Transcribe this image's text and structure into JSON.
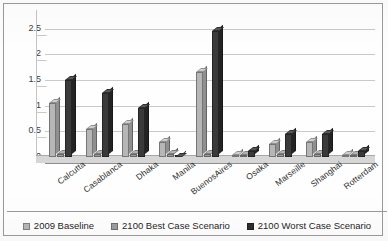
{
  "chart_data": {
    "type": "bar",
    "title": "",
    "xlabel": "",
    "ylabel": "",
    "ylim": [
      0,
      2.75
    ],
    "yticks": [
      0,
      0.5,
      1,
      1.5,
      2,
      2.5
    ],
    "ytick_labels": [
      "0",
      "0.5",
      "1",
      "1.5",
      "2",
      "2.5"
    ],
    "grid": true,
    "legend_position": "bottom",
    "three_d": true,
    "categories": [
      "Calcutta",
      "Casablanca",
      "Dhaka",
      "Manila",
      "BuenosAires",
      "Osaka",
      "Marseille",
      "Shanghai",
      "Rotterdam"
    ],
    "series": [
      {
        "name": "2009 Baseline",
        "color": "#b6b6b6",
        "values": [
          1.05,
          0.55,
          0.65,
          0.3,
          1.65,
          0.04,
          0.25,
          0.3,
          0.03
        ]
      },
      {
        "name": "2100 Best Case Scenario",
        "color": "#9d9d9d",
        "values": [
          0.06,
          0.05,
          0.05,
          0.05,
          0.05,
          0.03,
          0.05,
          0.05,
          0.03
        ]
      },
      {
        "name": "2100 Worst Case Scenario",
        "color": "#2f2f2f",
        "values": [
          1.5,
          1.25,
          0.95,
          0.0,
          2.45,
          0.12,
          0.45,
          0.45,
          0.12
        ]
      }
    ]
  },
  "legend": {
    "items": [
      {
        "label": "2009 Baseline",
        "swatch": "sw0"
      },
      {
        "label": "2100 Best Case Scenario",
        "swatch": "sw1"
      },
      {
        "label": "2100 Worst Case Scenario",
        "swatch": "sw2"
      }
    ]
  }
}
